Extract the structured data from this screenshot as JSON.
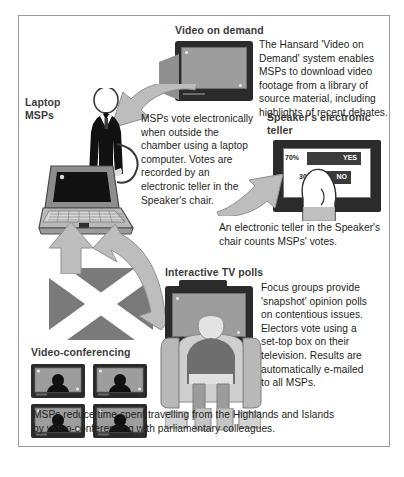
{
  "poster": {
    "title_semantic": "msp-technology-infographic",
    "frame_color": "#9a9a9a"
  },
  "sections": [
    {
      "id": "video-on-demand",
      "heading": "Video on demand",
      "body": "The Hansard 'Video on\nDemand' system enables\nMSPs to download video\nfootage from a library of\nsource material, including\nhighlights of recent debates."
    },
    {
      "id": "laptop-msps",
      "heading": "Laptop\nMSPs",
      "body": "MSPs vote electronically\nwhen outside the\nchamber using a laptop\ncomputer. Votes are\nrecorded by an\nelectronic teller in the\nSpeaker's chair."
    },
    {
      "id": "speakers-electronic-teller",
      "heading": "Speaker's electronic\nteller",
      "body": "An electronic teller in the Speaker's\nchair counts MSPs' votes."
    },
    {
      "id": "interactive-tv-polls",
      "heading": "Interactive TV polls",
      "body": "Focus groups provide\n'snapshot' opinion polls\non contentious issues.\nElectors vote using a\nset-top box on their\ntelevision. Results are\nautomatically e-mailed\nto all MSPs."
    },
    {
      "id": "video-conferencing",
      "heading": "Video-conferencing",
      "body": ""
    }
  ],
  "teller_screen": {
    "rows": [
      {
        "percent": "70%",
        "label": "YES",
        "bar_width_pct": 100
      },
      {
        "percent": "30%",
        "label": "NO",
        "bar_width_pct": 56
      }
    ]
  },
  "footer": {
    "caption": "MSPs reduce time spent travelling from the Highlands and Islands\nby video-conferencing with parliamentary colleagues."
  },
  "video_conference_tiles": [
    {
      "label": "participant-1"
    },
    {
      "label": "participant-2"
    },
    {
      "label": "participant-3"
    },
    {
      "label": "participant-4"
    }
  ],
  "colors": {
    "heading": "#3a3a3c",
    "body": "#231f20",
    "arrow_fill": "#b6b6b6",
    "arrow_stroke": "#8d8d8d",
    "monitor_case": "#2b2b2b",
    "screen": "#9d9d9d",
    "saltire_field": "#7a7a7a",
    "figure_dark": "#111111",
    "figure_mid": "#6e6e6e",
    "skin": "#dedede"
  }
}
